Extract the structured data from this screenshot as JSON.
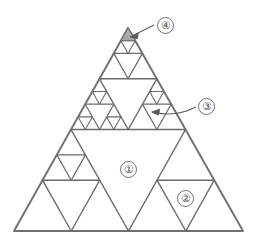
{
  "figure": {
    "type": "geometric-diagram",
    "outline": {
      "apex": [
        128,
        28
      ],
      "bottom_left": [
        14,
        231
      ],
      "bottom_right": [
        243,
        231
      ]
    },
    "stroke_color": "#6b6b6b",
    "outline_color": "#707070",
    "fill_color": "#a8a8a8",
    "background": "#ffffff"
  },
  "labels": {
    "one": {
      "text": "①",
      "name": "region-label-1",
      "points_to": "large central inverted triangle (level-1 hole)"
    },
    "two": {
      "text": "②",
      "name": "region-label-2",
      "points_to": "inverted triangle inside bottom-right sub-triangle (level-2 hole)"
    },
    "three": {
      "text": "③",
      "name": "region-label-3",
      "points_to": "inverted triangle inside upper-right sub-triangle (level-3 hole)",
      "has_arrow": true
    },
    "four": {
      "text": "④",
      "name": "region-label-4",
      "points_to": "shaded solid triangle at the apex (smallest upward triangle)",
      "has_arrow": true
    }
  },
  "annotations": {
    "arrow_three": {
      "from": [
        196,
        107
      ],
      "to": [
        152,
        113
      ]
    },
    "arrow_four": {
      "from": [
        154,
        25
      ],
      "to": [
        131,
        37
      ]
    }
  }
}
